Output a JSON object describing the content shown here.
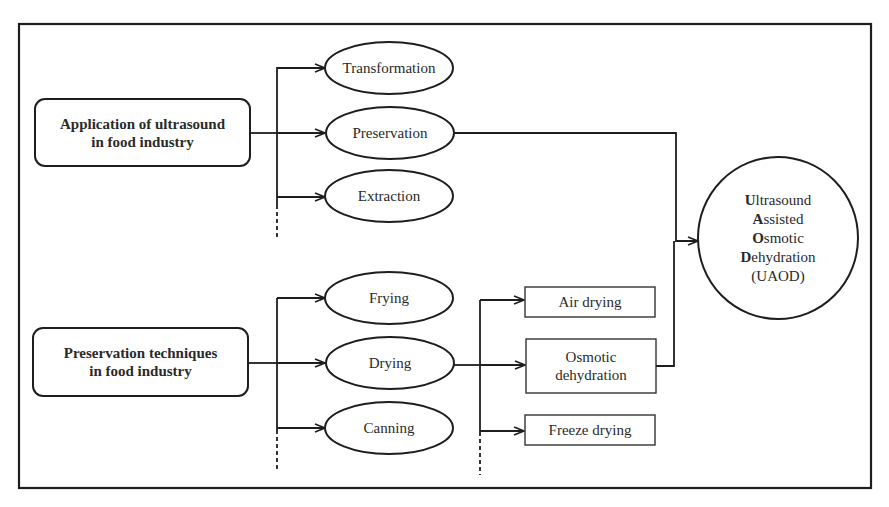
{
  "diagram": {
    "source_nodes": [
      {
        "id": "app",
        "label_line1": "Application of ultrasound",
        "label_line2": "in food industry"
      },
      {
        "id": "pres",
        "label_line1": "Preservation techniques",
        "label_line2": "in food industry"
      }
    ],
    "ultrasound_applications": [
      {
        "label": "Transformation"
      },
      {
        "label": "Preservation"
      },
      {
        "label": "Extraction"
      }
    ],
    "preservation_techniques": [
      {
        "label": "Frying"
      },
      {
        "label": "Drying"
      },
      {
        "label": "Canning"
      }
    ],
    "drying_methods": [
      {
        "label": "Air drying"
      },
      {
        "label": "Osmotic",
        "label_line2": "dehydration"
      },
      {
        "label": "Freeze drying"
      }
    ],
    "target": {
      "lines": [
        {
          "initial": "U",
          "rest": "ltrasound"
        },
        {
          "initial": "A",
          "rest": "ssisted"
        },
        {
          "initial": "O",
          "rest": "smotic"
        },
        {
          "initial": "D",
          "rest": "ehydration"
        }
      ],
      "abbreviation": "(UAOD)"
    },
    "edges": [
      "Application of ultrasound in food industry -> Transformation",
      "Application of ultrasound in food industry -> Preservation",
      "Application of ultrasound in food industry -> Extraction",
      "Preservation -> UAOD",
      "Preservation techniques in food industry -> Frying",
      "Preservation techniques in food industry -> Drying",
      "Preservation techniques in food industry -> Canning",
      "Drying -> Air drying",
      "Drying -> Osmotic dehydration",
      "Drying -> Freeze drying",
      "Osmotic dehydration -> UAOD"
    ],
    "colors": {
      "stroke": "#1e1e1e",
      "text": "#2a2a2a",
      "background": "#ffffff"
    }
  }
}
